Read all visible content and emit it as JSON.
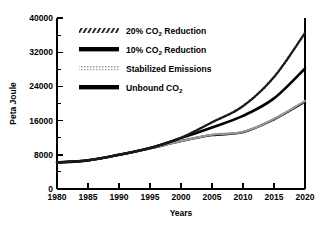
{
  "chart_data": {
    "type": "line",
    "title": "",
    "xlabel": "Years",
    "ylabel": "Peta Joule",
    "xlim": [
      1980,
      2020
    ],
    "ylim": [
      0,
      40000
    ],
    "grid": false,
    "legend_position": "upper-left-inside",
    "x_ticks": [
      1980,
      1985,
      1990,
      1995,
      2000,
      2005,
      2010,
      2015,
      2020
    ],
    "x_tick_labels": [
      "1980",
      "1985",
      "1990",
      "1995",
      "2000",
      "2005",
      "2010",
      "2015",
      "2020"
    ],
    "y_ticks": [
      0,
      8000,
      16000,
      24000,
      32000,
      40000
    ],
    "y_tick_labels": [
      "0",
      "8000",
      "16000",
      "24000",
      "32000",
      "40000"
    ],
    "y_minor_ticks": [
      4000,
      12000,
      20000,
      28000,
      36000
    ],
    "x": [
      1980,
      1985,
      1990,
      1995,
      2000,
      2005,
      2010,
      2015,
      2020
    ],
    "series": [
      {
        "name": "20% CO2 Reduction",
        "style": "hatched",
        "color": "#1a1a1a",
        "values": [
          6200,
          6700,
          8000,
          9600,
          12000,
          15600,
          19400,
          26200,
          36500
        ]
      },
      {
        "name": "10% CO2 Reduction",
        "style": "thick-solid",
        "color": "#000000",
        "values": [
          6200,
          6700,
          8000,
          9600,
          11900,
          14400,
          17100,
          21200,
          28200
        ]
      },
      {
        "name": "Stabilized Emissions",
        "style": "light-dotted",
        "color": "#8c8c8c",
        "values": [
          6200,
          6700,
          8000,
          9500,
          11200,
          12700,
          13400,
          16400,
          20600
        ]
      },
      {
        "name": "Unbound CO2",
        "style": "thick-solid",
        "color": "#000000",
        "values": [
          6200,
          6700,
          8000,
          9500,
          11200,
          12600,
          13300,
          16300,
          20400
        ]
      }
    ]
  },
  "legend": {
    "items": [
      {
        "prefix": "20% CO",
        "sub": "2",
        "suffix": " Reduction",
        "swatch": "hatched-swatch"
      },
      {
        "prefix": "10% CO",
        "sub": "2",
        "suffix": " Reduction",
        "swatch": "thick-solid-swatch"
      },
      {
        "prefix": "Stabilized Emissions",
        "sub": "",
        "suffix": "",
        "swatch": "light-dotted-swatch"
      },
      {
        "prefix": "Unbound CO",
        "sub": "2",
        "suffix": "",
        "swatch": "thick-solid-swatch"
      }
    ]
  },
  "colors": {
    "axis": "#000000",
    "background": "#ffffff",
    "dark_series": "#000000",
    "light_series": "#8c8c8c"
  }
}
